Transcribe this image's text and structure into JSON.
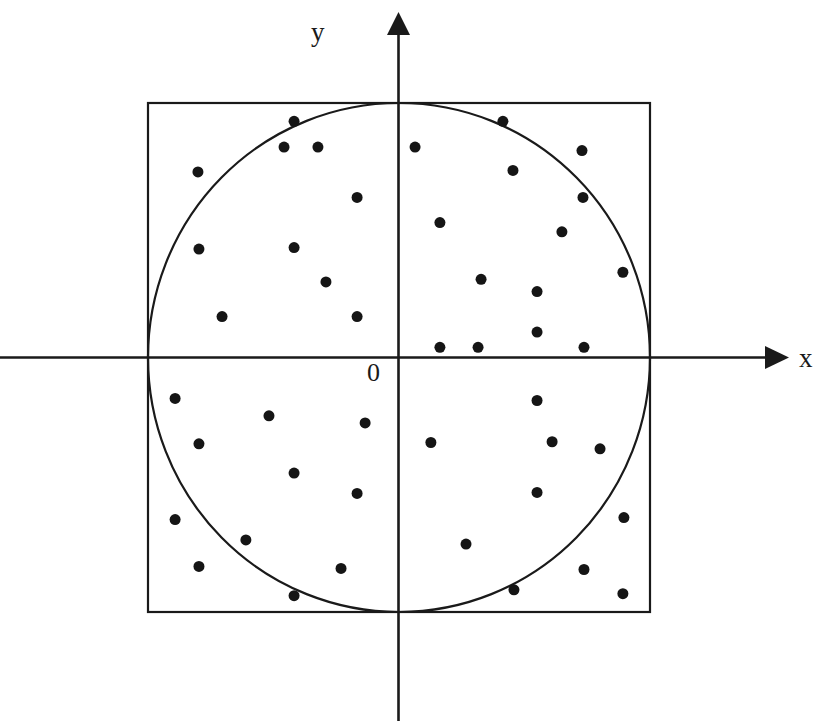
{
  "figure": {
    "background_color": "#ffffff",
    "stroke_color": "#1a1a1a",
    "point_color": "#151515"
  },
  "axes": {
    "x_label": "x",
    "y_label": "y",
    "origin_label": "0",
    "x_axis_name": "horizontal-axis",
    "y_axis_name": "vertical-axis",
    "x_arrow_icon": "arrow-right-icon",
    "y_arrow_icon": "arrow-up-icon"
  },
  "chart_data": {
    "type": "scatter",
    "subtitle": "",
    "xlabel": "x",
    "ylabel": "y",
    "xlim": [
      -1.35,
      1.55
    ],
    "ylim": [
      -1.45,
      1.42
    ],
    "grid": false,
    "legend": null,
    "annotations": [
      {
        "text": "0",
        "x": -0.11,
        "y": -0.13
      },
      {
        "text": "x",
        "x": 1.6,
        "y": 0.02
      },
      {
        "text": "y",
        "x": -0.29,
        "y": 1.33
      }
    ],
    "shapes": [
      {
        "name": "bounding-square",
        "type": "rect",
        "x": -1.0,
        "y": -1.0,
        "width": 2.0,
        "height": 2.0,
        "fill": "none",
        "stroke": "#1a1a1a",
        "stroke_width": 2
      },
      {
        "name": "inscribed-circle",
        "type": "circle",
        "cx": 0.0,
        "cy": 0.0,
        "r": 1.0,
        "fill": "none",
        "stroke": "#1a1a1a",
        "stroke_width": 2
      }
    ],
    "marker": {
      "shape": "circle",
      "size": 11,
      "color": "#151515"
    },
    "point_count": 45,
    "series": [
      {
        "name": "random-points",
        "points": [
          [
            -0.418,
            0.928
          ],
          [
            -0.458,
            0.827
          ],
          [
            -0.323,
            0.827
          ],
          [
            -0.801,
            0.729
          ],
          [
            -0.167,
            0.629
          ],
          [
            -0.797,
            0.426
          ],
          [
            -0.418,
            0.432
          ],
          [
            -0.291,
            0.297
          ],
          [
            -0.705,
            0.161
          ],
          [
            -0.167,
            0.161
          ],
          [
            0.414,
            0.928
          ],
          [
            0.064,
            0.827
          ],
          [
            0.729,
            0.813
          ],
          [
            0.454,
            0.735
          ],
          [
            0.733,
            0.629
          ],
          [
            0.163,
            0.53
          ],
          [
            0.649,
            0.494
          ],
          [
            0.892,
            0.335
          ],
          [
            0.327,
            0.307
          ],
          [
            0.55,
            0.259
          ],
          [
            0.55,
            0.1
          ],
          [
            0.163,
            0.04
          ],
          [
            0.315,
            0.04
          ],
          [
            0.737,
            0.04
          ],
          [
            -0.892,
            -0.161
          ],
          [
            -0.518,
            -0.229
          ],
          [
            -0.135,
            -0.257
          ],
          [
            -0.797,
            -0.339
          ],
          [
            -0.418,
            -0.454
          ],
          [
            -0.167,
            -0.534
          ],
          [
            -0.892,
            -0.637
          ],
          [
            -0.61,
            -0.717
          ],
          [
            -0.797,
            -0.821
          ],
          [
            -0.231,
            -0.829
          ],
          [
            -0.418,
            -0.936
          ],
          [
            0.55,
            -0.169
          ],
          [
            0.127,
            -0.334
          ],
          [
            0.61,
            -0.331
          ],
          [
            0.801,
            -0.359
          ],
          [
            0.55,
            -0.53
          ],
          [
            0.896,
            -0.629
          ],
          [
            0.267,
            -0.733
          ],
          [
            0.737,
            -0.833
          ],
          [
            0.458,
            -0.913
          ],
          [
            0.892,
            -0.928
          ]
        ]
      }
    ]
  }
}
